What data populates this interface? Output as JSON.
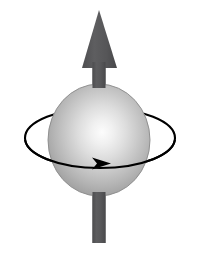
{
  "figure": {
    "title": "Spinning sphere with spin angular momentum vector",
    "background_color": "#ffffff",
    "width": 200,
    "height": 256
  },
  "colors": {
    "background": "#ffffff",
    "arrow_dark": "#58585a",
    "arrow_dark_edge": "#4a4a4c",
    "sphere_highlight": "#fbfbfb",
    "sphere_mid": "#c9c9c9",
    "sphere_edge": "#8f8f8f",
    "sphere_rim": "#7d7d7d",
    "orbit_stroke": "#000000"
  },
  "elements": {
    "spin_vector": {
      "name": "spin vector arrow",
      "direction": "up",
      "label": "",
      "head": {
        "tip_x": 99,
        "tip_y": 10,
        "base_y": 68,
        "base_left_x": 82,
        "base_right_x": 117
      },
      "shaft": {
        "center_x": 99,
        "width": 13,
        "top_y": 62,
        "bottom_y": 243
      }
    },
    "sphere": {
      "name": "sphere",
      "center_x": 99,
      "center_y": 140,
      "radius_x": 51,
      "radius_y": 56,
      "highlight_x": 105,
      "highlight_y": 136
    },
    "orbit": {
      "name": "rotation orbit ellipse",
      "center_x": 100,
      "center_y": 138,
      "radius_x": 75,
      "radius_y": 30,
      "stroke_width": 2.1,
      "direction": "clockwise-viewed-from-above",
      "arrowhead": {
        "x": 104,
        "y": 163,
        "points": "right"
      }
    }
  },
  "caption": ""
}
